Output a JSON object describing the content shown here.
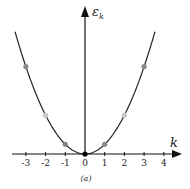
{
  "chart_data": {
    "type": "line",
    "title": "",
    "xlabel": "k",
    "ylabel": "ε_k",
    "ylabel_main": "ε",
    "ylabel_sub": "k",
    "caption": "(a)",
    "x_ticks": [
      "-3",
      "-2",
      "-1",
      "0",
      "1",
      "2",
      "3",
      "4"
    ],
    "xlim": [
      -3.8,
      4.5
    ],
    "grid": false,
    "legend": null,
    "curve": "parabola ε = k²",
    "points": [
      {
        "k": -3,
        "e": 9,
        "color": "#8a8a8a"
      },
      {
        "k": -2,
        "e": 4,
        "color": "#c8c8c8"
      },
      {
        "k": -1,
        "e": 1,
        "color": "#7a8a7a"
      },
      {
        "k": 0,
        "e": 0,
        "color": "#000000"
      },
      {
        "k": 1,
        "e": 1,
        "color": "#8a8a8a"
      },
      {
        "k": 2,
        "e": 4,
        "color": "#c8c8c8"
      },
      {
        "k": 3,
        "e": 9,
        "color": "#8a8a8a"
      }
    ]
  }
}
